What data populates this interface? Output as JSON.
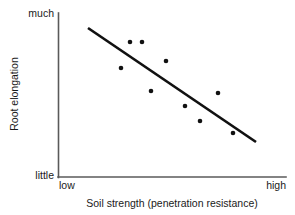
{
  "chart_data": {
    "type": "scatter",
    "title": "",
    "subtitle": "",
    "xlabel": "Soil strength (penetration resistance)",
    "ylabel": "Root elongation",
    "xlim": [
      0,
      100
    ],
    "ylim": [
      0,
      100
    ],
    "grid": false,
    "legend": "none",
    "x_tick_labels": [
      "low",
      "high"
    ],
    "y_tick_labels": [
      "little",
      "much"
    ],
    "axis_note": "Qualitative axes: x runs low to high, y runs little to much; no numeric scale is printed.",
    "points": [
      {
        "x": 31,
        "y": 82
      },
      {
        "x": 38,
        "y": 82
      },
      {
        "x": 27,
        "y": 66
      },
      {
        "x": 47,
        "y": 71
      },
      {
        "x": 41,
        "y": 52
      },
      {
        "x": 54,
        "y": 43
      },
      {
        "x": 61,
        "y": 35
      },
      {
        "x": 70,
        "y": 51
      },
      {
        "x": 77,
        "y": 27
      },
      {
        "x": 59,
        "y": 36
      },
      {
        "x": 44,
        "y": 53
      }
    ],
    "points_px": [
      {
        "cx": 130,
        "cy": 42
      },
      {
        "cx": 142,
        "cy": 42
      },
      {
        "cx": 121,
        "cy": 68
      },
      {
        "cx": 166,
        "cy": 61
      },
      {
        "cx": 151,
        "cy": 91
      },
      {
        "cx": 185,
        "cy": 106
      },
      {
        "cx": 200,
        "cy": 121
      },
      {
        "cx": 218,
        "cy": 93
      },
      {
        "cx": 233,
        "cy": 133
      },
      {
        "cx": 198,
        "cy": 119
      },
      {
        "cx": 152,
        "cy": 90
      }
    ],
    "trend_line": {
      "description": "negative linear trend",
      "x1": 88,
      "y1": 28,
      "x2": 256,
      "y2": 142
    },
    "series": [
      {
        "name": "Root elongation vs soil strength",
        "x": [
          31,
          38,
          27,
          47,
          41,
          54,
          61,
          70,
          77,
          59,
          44
        ],
        "values": [
          82,
          82,
          66,
          71,
          52,
          43,
          35,
          51,
          27,
          36,
          53
        ]
      }
    ]
  },
  "figure": {
    "xaxis_title": "Soil strength (penetration resistance)",
    "yaxis_title": "Root elongation",
    "y_top_label": "much",
    "y_bottom_label": "little",
    "x_left_label": "low",
    "x_right_label": "high"
  },
  "colors": {
    "background": "#ffffff",
    "axis": "#5a5a5a",
    "trend_line": "#111111",
    "dots": "#111111",
    "text": "#1a1a1a"
  }
}
